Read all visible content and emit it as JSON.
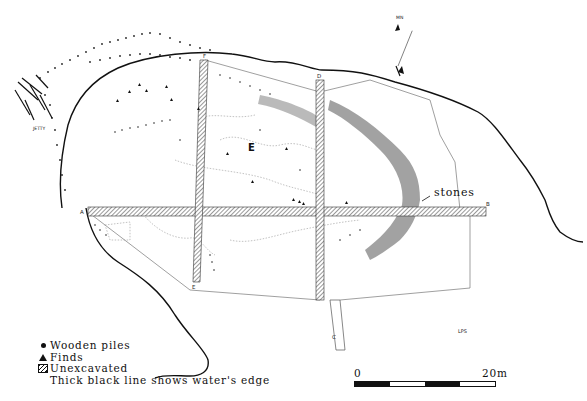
{
  "figure": {
    "type": "archaeological-site-plan",
    "north_arrow_label": "MN",
    "area_label": "E",
    "feature_labels": {
      "jetty": "JETTY",
      "stones": "stones"
    },
    "trench_endpoints": {
      "A": "A",
      "B": "B",
      "C": "C",
      "D": "D",
      "E": "E",
      "F": "F"
    },
    "corner_note": "LPS"
  },
  "legend": {
    "items": [
      {
        "symbol": "dot",
        "icon": "dot-icon",
        "label": "Wooden piles"
      },
      {
        "symbol": "triangle",
        "icon": "triangle-icon",
        "label": "Finds"
      },
      {
        "symbol": "hatch",
        "icon": "hatch-icon",
        "label": "Unexcavated"
      }
    ],
    "note": "Thick black line shows water's edge"
  },
  "scale_bar": {
    "start_label": "0",
    "end_label": "20m",
    "segments": [
      "dark",
      "light",
      "dark",
      "light"
    ]
  },
  "colors": {
    "ink": "#111111",
    "background": "#ffffff",
    "light_line": "#777777"
  }
}
